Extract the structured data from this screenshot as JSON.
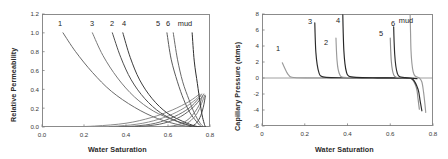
{
  "figure": {
    "panel_count": 2,
    "background": "#ffffff"
  },
  "chart_data": [
    {
      "panel": "left",
      "type": "line",
      "title": "",
      "xlabel": "Water Saturation",
      "ylabel": "Relative Permeability",
      "xlim": [
        0.0,
        0.8
      ],
      "ylim": [
        0.0,
        1.2
      ],
      "xticks": [
        "0.0",
        "0.2",
        "0.4",
        "0.6",
        "0.8"
      ],
      "xtick_values": [
        0.0,
        0.2,
        0.4,
        0.6,
        0.8
      ],
      "yticks": [
        "0.0",
        "0.2",
        "0.4",
        "0.6",
        "0.8",
        "1.0",
        "1.2"
      ],
      "ytick_values": [
        0.0,
        0.2,
        0.4,
        0.6,
        0.8,
        1.0,
        1.2
      ],
      "grid": false,
      "legend_position": "inline-curve-labels",
      "annotations": [
        "1",
        "3",
        "2",
        "4",
        "5",
        "6",
        "mud"
      ],
      "series": [
        {
          "name": "1",
          "label": "1",
          "color": "#6b6b6b",
          "role": "water-relative-permeability-declining",
          "points": [
            [
              0.1,
              1.0
            ],
            [
              0.16,
              0.8
            ],
            [
              0.24,
              0.58
            ],
            [
              0.33,
              0.38
            ],
            [
              0.44,
              0.21
            ],
            [
              0.55,
              0.09
            ],
            [
              0.66,
              0.02
            ],
            [
              0.74,
              0.0
            ]
          ]
        },
        {
          "name": "1b",
          "label": "",
          "color": "#8a8a8a",
          "role": "oil-relative-permeability-rising",
          "points": [
            [
              0.1,
              0.0
            ],
            [
              0.25,
              0.01
            ],
            [
              0.4,
              0.04
            ],
            [
              0.52,
              0.1
            ],
            [
              0.62,
              0.18
            ],
            [
              0.7,
              0.27
            ],
            [
              0.75,
              0.35
            ]
          ]
        },
        {
          "name": "3",
          "label": "3",
          "color": "#7a7a7a",
          "role": "water-relative-permeability-declining",
          "points": [
            [
              0.24,
              1.0
            ],
            [
              0.29,
              0.76
            ],
            [
              0.36,
              0.52
            ],
            [
              0.44,
              0.32
            ],
            [
              0.53,
              0.17
            ],
            [
              0.63,
              0.07
            ],
            [
              0.71,
              0.01
            ],
            [
              0.75,
              0.0
            ]
          ]
        },
        {
          "name": "3b",
          "label": "",
          "color": "#8f8f8f",
          "role": "oil-relative-permeability-rising",
          "points": [
            [
              0.22,
              0.0
            ],
            [
              0.36,
              0.01
            ],
            [
              0.48,
              0.04
            ],
            [
              0.58,
              0.1
            ],
            [
              0.66,
              0.18
            ],
            [
              0.72,
              0.27
            ],
            [
              0.755,
              0.34
            ]
          ]
        },
        {
          "name": "2",
          "label": "2",
          "color": "#4f4f4f",
          "role": "water-relative-permeability-declining",
          "points": [
            [
              0.335,
              1.0
            ],
            [
              0.375,
              0.74
            ],
            [
              0.425,
              0.5
            ],
            [
              0.49,
              0.3
            ],
            [
              0.565,
              0.15
            ],
            [
              0.645,
              0.06
            ],
            [
              0.715,
              0.01
            ],
            [
              0.755,
              0.0
            ]
          ]
        },
        {
          "name": "2b",
          "label": "",
          "color": "#6f6f6f",
          "role": "oil-relative-permeability-rising",
          "points": [
            [
              0.32,
              0.0
            ],
            [
              0.44,
              0.01
            ],
            [
              0.54,
              0.04
            ],
            [
              0.63,
              0.11
            ],
            [
              0.7,
              0.2
            ],
            [
              0.745,
              0.3
            ],
            [
              0.76,
              0.35
            ]
          ]
        },
        {
          "name": "4",
          "label": "4",
          "color": "#3d3d3d",
          "role": "water-relative-permeability-declining",
          "points": [
            [
              0.385,
              1.0
            ],
            [
              0.42,
              0.74
            ],
            [
              0.465,
              0.5
            ],
            [
              0.525,
              0.3
            ],
            [
              0.595,
              0.15
            ],
            [
              0.67,
              0.06
            ],
            [
              0.73,
              0.01
            ],
            [
              0.765,
              0.0
            ]
          ]
        },
        {
          "name": "4b",
          "label": "",
          "color": "#636363",
          "role": "oil-relative-permeability-rising",
          "points": [
            [
              0.37,
              0.0
            ],
            [
              0.49,
              0.01
            ],
            [
              0.58,
              0.04
            ],
            [
              0.66,
              0.11
            ],
            [
              0.72,
              0.21
            ],
            [
              0.755,
              0.3
            ],
            [
              0.77,
              0.35
            ]
          ]
        },
        {
          "name": "5",
          "label": "5",
          "color": "#5a5a5a",
          "role": "water-relative-permeability-declining",
          "points": [
            [
              0.595,
              1.0
            ],
            [
              0.615,
              0.72
            ],
            [
              0.645,
              0.48
            ],
            [
              0.675,
              0.29
            ],
            [
              0.705,
              0.15
            ],
            [
              0.735,
              0.06
            ],
            [
              0.755,
              0.01
            ],
            [
              0.765,
              0.0
            ]
          ]
        },
        {
          "name": "5b",
          "label": "",
          "color": "#7c7c7c",
          "role": "oil-relative-permeability-rising",
          "points": [
            [
              0.58,
              0.0
            ],
            [
              0.64,
              0.02
            ],
            [
              0.69,
              0.07
            ],
            [
              0.725,
              0.15
            ],
            [
              0.75,
              0.24
            ],
            [
              0.765,
              0.33
            ]
          ]
        },
        {
          "name": "6",
          "label": "6",
          "color": "#6a6a6a",
          "role": "water-relative-permeability-declining",
          "points": [
            [
              0.625,
              1.0
            ],
            [
              0.645,
              0.72
            ],
            [
              0.67,
              0.48
            ],
            [
              0.7,
              0.29
            ],
            [
              0.725,
              0.15
            ],
            [
              0.75,
              0.05
            ],
            [
              0.765,
              0.01
            ],
            [
              0.775,
              0.0
            ]
          ]
        },
        {
          "name": "6b",
          "label": "",
          "color": "#848484",
          "role": "oil-relative-permeability-rising",
          "points": [
            [
              0.61,
              0.0
            ],
            [
              0.67,
              0.02
            ],
            [
              0.71,
              0.07
            ],
            [
              0.74,
              0.15
            ],
            [
              0.76,
              0.25
            ],
            [
              0.775,
              0.34
            ]
          ]
        },
        {
          "name": "mud",
          "label": "mud",
          "color": "#2e2e2e",
          "role": "water-relative-permeability-declining",
          "points": [
            [
              0.715,
              1.0
            ],
            [
              0.725,
              0.7
            ],
            [
              0.74,
              0.46
            ],
            [
              0.752,
              0.27
            ],
            [
              0.762,
              0.13
            ],
            [
              0.772,
              0.04
            ],
            [
              0.778,
              0.0
            ]
          ]
        },
        {
          "name": "mudb",
          "label": "",
          "color": "#4a4a4a",
          "role": "oil-relative-permeability-rising",
          "points": [
            [
              0.7,
              0.0
            ],
            [
              0.73,
              0.03
            ],
            [
              0.752,
              0.1
            ],
            [
              0.768,
              0.21
            ],
            [
              0.778,
              0.33
            ]
          ]
        }
      ]
    },
    {
      "panel": "right",
      "type": "line",
      "title": "",
      "xlabel": "Water Saturation",
      "ylabel": "Capillary Pressure (atms)",
      "xlim": [
        0.0,
        0.8
      ],
      "ylim": [
        -6,
        8
      ],
      "xticks": [
        "0",
        "0.2",
        "0.4",
        "0.6",
        "0.8"
      ],
      "xtick_values": [
        0.0,
        0.2,
        0.4,
        0.6,
        0.8
      ],
      "yticks": [
        "8",
        "6",
        "4",
        "2",
        "0",
        "-2",
        "-4",
        "-6"
      ],
      "ytick_values": [
        8,
        6,
        4,
        2,
        0,
        -2,
        -4,
        -6
      ],
      "grid": false,
      "zero_line": true,
      "legend_position": "inline-curve-labels",
      "annotations": [
        "1",
        "3",
        "2",
        "4",
        "5",
        "6",
        "mud"
      ],
      "series": [
        {
          "name": "1",
          "label": "1",
          "color": "#9a9a9a",
          "points": [
            [
              0.095,
              1.9
            ],
            [
              0.105,
              1.3
            ],
            [
              0.115,
              0.75
            ],
            [
              0.125,
              0.35
            ],
            [
              0.14,
              0.1
            ],
            [
              0.2,
              0.02
            ],
            [
              0.35,
              0.0
            ],
            [
              0.55,
              0.0
            ],
            [
              0.7,
              -0.02
            ]
          ]
        },
        {
          "name": "3",
          "label": "3",
          "color": "#2b2b2b",
          "points": [
            [
              0.247,
              6.9
            ],
            [
              0.249,
              5.0
            ],
            [
              0.252,
              3.2
            ],
            [
              0.258,
              1.7
            ],
            [
              0.266,
              0.7
            ],
            [
              0.275,
              0.25
            ],
            [
              0.3,
              0.08
            ],
            [
              0.38,
              0.03
            ],
            [
              0.5,
              0.01
            ],
            [
              0.62,
              0.0
            ],
            [
              0.71,
              -0.05
            ]
          ]
        },
        {
          "name": "2",
          "label": "2",
          "color": "#9a9a9a",
          "points": [
            [
              0.346,
              5.0
            ],
            [
              0.348,
              3.6
            ],
            [
              0.351,
              2.2
            ],
            [
              0.356,
              1.1
            ],
            [
              0.364,
              0.4
            ],
            [
              0.375,
              0.12
            ],
            [
              0.42,
              0.04
            ],
            [
              0.52,
              0.01
            ],
            [
              0.64,
              0.0
            ],
            [
              0.72,
              -0.04
            ]
          ]
        },
        {
          "name": "4",
          "label": "4",
          "color": "#262626",
          "points": [
            [
              0.378,
              7.9
            ],
            [
              0.38,
              5.6
            ],
            [
              0.383,
              3.4
            ],
            [
              0.388,
              1.8
            ],
            [
              0.395,
              0.75
            ],
            [
              0.405,
              0.25
            ],
            [
              0.44,
              0.08
            ],
            [
              0.54,
              0.02
            ],
            [
              0.64,
              0.0
            ],
            [
              0.725,
              -0.08
            ]
          ]
        },
        {
          "name": "5",
          "label": "5",
          "color": "#8e8e8e",
          "points": [
            [
              0.6,
              5.0
            ],
            [
              0.602,
              3.5
            ],
            [
              0.605,
              2.1
            ],
            [
              0.61,
              1.0
            ],
            [
              0.617,
              0.35
            ],
            [
              0.628,
              0.1
            ],
            [
              0.66,
              0.02
            ],
            [
              0.7,
              -0.1
            ],
            [
              0.722,
              -1.2
            ],
            [
              0.73,
              -2.6
            ],
            [
              0.736,
              -3.9
            ]
          ]
        },
        {
          "name": "6",
          "label": "6",
          "color": "#2b2b2b",
          "points": [
            [
              0.616,
              6.4
            ],
            [
              0.618,
              4.6
            ],
            [
              0.621,
              2.9
            ],
            [
              0.626,
              1.5
            ],
            [
              0.633,
              0.6
            ],
            [
              0.643,
              0.18
            ],
            [
              0.67,
              0.04
            ],
            [
              0.705,
              -0.15
            ],
            [
              0.73,
              -1.4
            ],
            [
              0.74,
              -2.9
            ],
            [
              0.748,
              -4.1
            ]
          ]
        },
        {
          "name": "mud",
          "label": "mud",
          "color": "#9a9a9a",
          "points": [
            [
              0.693,
              7.9
            ],
            [
              0.695,
              5.6
            ],
            [
              0.697,
              3.5
            ],
            [
              0.701,
              1.9
            ],
            [
              0.707,
              0.8
            ],
            [
              0.716,
              0.25
            ],
            [
              0.735,
              0.02
            ],
            [
              0.748,
              -0.5
            ],
            [
              0.756,
              -1.8
            ],
            [
              0.762,
              -3.2
            ],
            [
              0.766,
              -4.3
            ]
          ]
        }
      ]
    }
  ],
  "left_panel": {
    "curve_labels": [
      {
        "text": "1",
        "x": 60,
        "y": 19
      },
      {
        "text": "3",
        "x": 92,
        "y": 19
      },
      {
        "text": "2",
        "x": 112,
        "y": 19
      },
      {
        "text": "4",
        "x": 124,
        "y": 19
      },
      {
        "text": "5",
        "x": 158,
        "y": 19
      },
      {
        "text": "6",
        "x": 168,
        "y": 19
      },
      {
        "text": "mud",
        "x": 185,
        "y": 19
      }
    ]
  },
  "right_panel": {
    "curve_labels": [
      {
        "text": "1",
        "x": 278,
        "y": 44
      },
      {
        "text": "3",
        "x": 310,
        "y": 17
      },
      {
        "text": "2",
        "x": 326,
        "y": 38
      },
      {
        "text": "4",
        "x": 338,
        "y": 16
      },
      {
        "text": "5",
        "x": 381,
        "y": 29
      },
      {
        "text": "6",
        "x": 393,
        "y": 19
      },
      {
        "text": "mud",
        "x": 406,
        "y": 16
      }
    ]
  },
  "axes_style": {
    "frame_color": "#7f7f7f",
    "tick_color": "#7f7f7f",
    "text_color": "#2b2b2b"
  }
}
